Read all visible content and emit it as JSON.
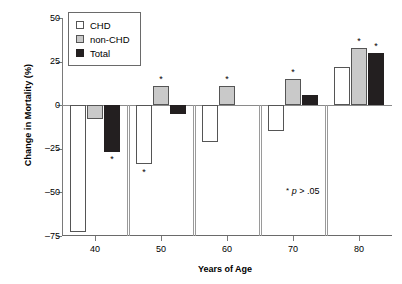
{
  "chart_data": {
    "type": "bar",
    "title": "",
    "xlabel": "Years of Age",
    "ylabel": "Change in Mortality (%)",
    "categories": [
      "40",
      "50",
      "60",
      "70",
      "80"
    ],
    "ylim": [
      -75,
      50
    ],
    "yticks": [
      50,
      25,
      0,
      -25,
      -50,
      -75
    ],
    "ytick_labels": [
      "50",
      "25",
      "0",
      "–25",
      "–50",
      "–75"
    ],
    "grid": false,
    "legend_position": "top-left",
    "series": [
      {
        "name": "CHD",
        "values": [
          -73,
          -34,
          -21,
          -15,
          22
        ]
      },
      {
        "name": "non-CHD",
        "values": [
          -8,
          11,
          11,
          15,
          33
        ]
      },
      {
        "name": "Total",
        "values": [
          -27,
          -5,
          0,
          6,
          30
        ]
      }
    ],
    "significance_markers": [
      {
        "series": "Total",
        "category": "40",
        "symbol": "*"
      },
      {
        "series": "CHD",
        "category": "50",
        "symbol": "*"
      },
      {
        "series": "non-CHD",
        "category": "50",
        "symbol": "*"
      },
      {
        "series": "non-CHD",
        "category": "60",
        "symbol": "*"
      },
      {
        "series": "non-CHD",
        "category": "70",
        "symbol": "*"
      },
      {
        "series": "non-CHD",
        "category": "80",
        "symbol": "*"
      },
      {
        "series": "Total",
        "category": "80",
        "symbol": "*"
      }
    ],
    "annotations": [
      {
        "name": "p-value-note",
        "star": "*",
        "p": "p",
        "rest": "> .05"
      }
    ]
  },
  "legend": {
    "items": [
      {
        "label": "CHD",
        "color": "#ffffff"
      },
      {
        "label": "non-CHD",
        "color": "#c9c9c9"
      },
      {
        "label": "Total",
        "color": "#231f20"
      }
    ]
  },
  "axes": {
    "y_title": "Change in Mortality (%)",
    "x_title": "Years of Age"
  }
}
